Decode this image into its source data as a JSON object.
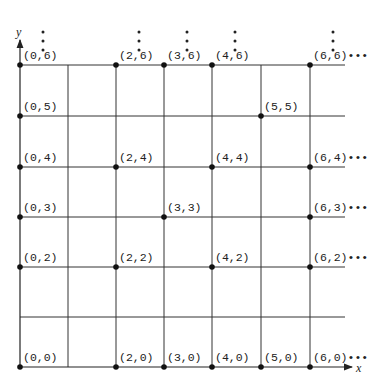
{
  "diagram": {
    "type": "lattice-grid",
    "x_axis_label": "x",
    "y_axis_label": "y",
    "grid": {
      "x_lines": [
        20,
        68,
        116,
        164,
        212,
        261,
        310
      ],
      "y_lines": [
        65,
        116,
        167,
        217,
        267,
        317,
        367
      ],
      "x_end": 345,
      "line_color": "#333333"
    },
    "points": [
      {
        "label": "(0,6)",
        "gx": 0,
        "gy": 6
      },
      {
        "label": "(2,6)",
        "gx": 2,
        "gy": 6
      },
      {
        "label": "(3,6)",
        "gx": 3,
        "gy": 6
      },
      {
        "label": "(4,6)",
        "gx": 4,
        "gy": 6
      },
      {
        "label": "(6,6)",
        "gx": 6,
        "gy": 6,
        "trail": "•••"
      },
      {
        "label": "(0,5)",
        "gx": 0,
        "gy": 5
      },
      {
        "label": "(5,5)",
        "gx": 5,
        "gy": 5
      },
      {
        "label": "(0,4)",
        "gx": 0,
        "gy": 4
      },
      {
        "label": "(2,4)",
        "gx": 2,
        "gy": 4
      },
      {
        "label": "(4,4)",
        "gx": 4,
        "gy": 4
      },
      {
        "label": "(6,4)",
        "gx": 6,
        "gy": 4,
        "trail": "•••"
      },
      {
        "label": "(0,3)",
        "gx": 0,
        "gy": 3
      },
      {
        "label": "(3,3)",
        "gx": 3,
        "gy": 3
      },
      {
        "label": "(6,3)",
        "gx": 6,
        "gy": 3,
        "trail": "•••"
      },
      {
        "label": "(0,2)",
        "gx": 0,
        "gy": 2
      },
      {
        "label": "(2,2)",
        "gx": 2,
        "gy": 2
      },
      {
        "label": "(4,2)",
        "gx": 4,
        "gy": 2
      },
      {
        "label": "(6,2)",
        "gx": 6,
        "gy": 2,
        "trail": "•••"
      },
      {
        "label": "(0,0)",
        "gx": 0,
        "gy": 0
      },
      {
        "label": "(2,0)",
        "gx": 2,
        "gy": 0
      },
      {
        "label": "(3,0)",
        "gx": 3,
        "gy": 0
      },
      {
        "label": "(4,0)",
        "gx": 4,
        "gy": 0
      },
      {
        "label": "(5,0)",
        "gx": 5,
        "gy": 0
      },
      {
        "label": "(6,0)",
        "gx": 6,
        "gy": 0,
        "trail": "•••"
      }
    ],
    "vertical_ellipsis_columns": [
      0,
      2,
      3,
      4,
      6
    ]
  }
}
